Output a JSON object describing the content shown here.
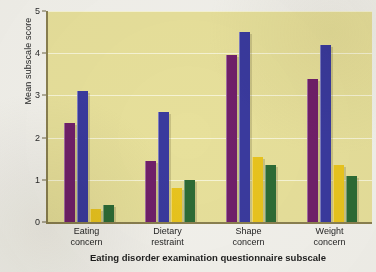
{
  "chart_data": {
    "type": "bar",
    "title": "",
    "xlabel": "Eating disorder examination questionnaire subscale",
    "ylabel": "Mean subscale score",
    "ylim": [
      0,
      5
    ],
    "ytick_values": [
      0,
      1,
      2,
      3,
      4,
      5
    ],
    "ytick_labels": [
      "0",
      "1",
      "2",
      "3",
      "4",
      "5"
    ],
    "grid": true,
    "legend": "none",
    "background_color": "#e7e09b",
    "categories": [
      "Eating concern",
      "Dietary restraint",
      "Shape concern",
      "Weight concern"
    ],
    "category_lines": [
      [
        "Eating",
        "concern"
      ],
      [
        "Dietary",
        "restraint"
      ],
      [
        "Shape",
        "concern"
      ],
      [
        "Weight",
        "concern"
      ]
    ],
    "series": [
      {
        "name": "series-1",
        "color": "#70206a",
        "values": [
          2.35,
          1.45,
          3.95,
          3.4
        ]
      },
      {
        "name": "series-2",
        "color": "#3a3a9e",
        "values": [
          3.1,
          2.6,
          4.5,
          4.2
        ]
      },
      {
        "name": "series-3",
        "color": "#e8c41e",
        "values": [
          0.3,
          0.8,
          1.55,
          1.35
        ]
      },
      {
        "name": "series-4",
        "color": "#2d6b35",
        "values": [
          0.4,
          1.0,
          1.35,
          1.1
        ]
      }
    ]
  }
}
